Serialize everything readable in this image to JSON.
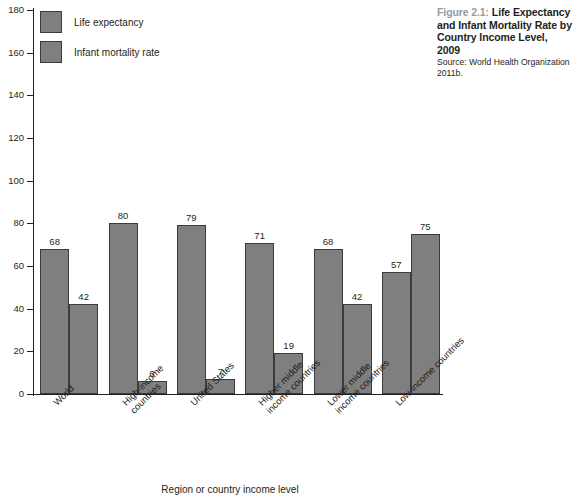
{
  "caption": {
    "figure_number": "Figure 2.1:",
    "title": " Life Expectancy and Infant Mortality Rate by Country Income Level, 2009",
    "source": "Source: World Health Organization 2011b."
  },
  "chart_data": {
    "type": "bar",
    "title": "Life Expectancy and Infant Mortality Rate by Country Income Level, 2009",
    "xlabel": "Region or country income level",
    "ylabel": "",
    "ylim": [
      0,
      180
    ],
    "yticks": [
      0,
      20,
      40,
      60,
      80,
      100,
      120,
      140,
      160,
      180
    ],
    "grid": false,
    "legend_position": "top-left-inside",
    "categories": [
      "World",
      "High-income countries",
      "United States",
      "Higher middle income countries",
      "Lower middle income countries",
      "Low-income countries"
    ],
    "category_lines": [
      [
        "World"
      ],
      [
        "High-income",
        "countries"
      ],
      [
        "United States"
      ],
      [
        "Higher middle",
        "income countries"
      ],
      [
        "Lower middle",
        "income countries"
      ],
      [
        "Low-income countries"
      ]
    ],
    "series": [
      {
        "name": "Life expectancy",
        "values": [
          68,
          80,
          79,
          71,
          68,
          57
        ],
        "color": "#7f7f7f"
      },
      {
        "name": "Infant mortality rate",
        "values": [
          42,
          6,
          7,
          19,
          42,
          75
        ],
        "color": "#7f7f7f"
      }
    ]
  },
  "colors": {
    "bar_fill": "#7f7f7f",
    "bar_stroke": "#3b3b3b",
    "axis": "#231f20",
    "figure_number": "#9a9a9a",
    "text": "#231f20"
  }
}
